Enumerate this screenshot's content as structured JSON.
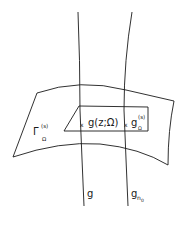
{
  "diagram": {
    "colors": {
      "stroke": "#1a1a1a",
      "background": "#ffffff"
    },
    "surface_label": {
      "main": "Γ",
      "sup": "(s)",
      "sub": "Ω"
    },
    "point_label_left": {
      "marker": "x",
      "text": "g(z;Ω)"
    },
    "point_label_right": {
      "marker": "x",
      "main": "g",
      "sup": "(s)",
      "sub": "Ω"
    },
    "curve_label_left": "g",
    "curve_label_right": {
      "main": "g",
      "sub": "n",
      "subsub": "0"
    }
  }
}
